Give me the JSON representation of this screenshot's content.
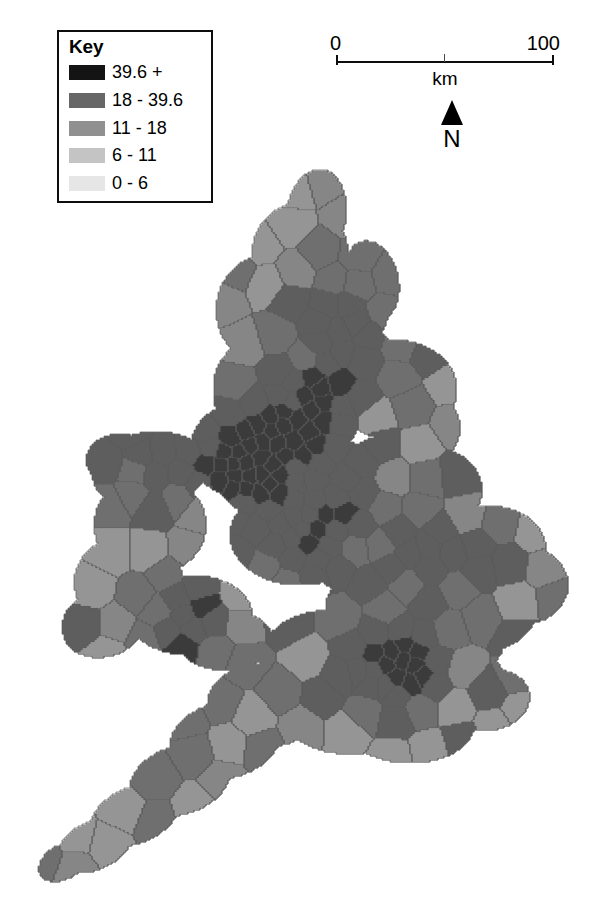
{
  "legend": {
    "title": "Key",
    "classes": [
      {
        "label": "39.6 +",
        "color": "#141414",
        "range_min": 39.6,
        "range_max": null
      },
      {
        "label": "18 - 39.6",
        "color": "#676767",
        "range_min": 18,
        "range_max": 39.6
      },
      {
        "label": "11 - 18",
        "color": "#909090",
        "range_min": 11,
        "range_max": 18
      },
      {
        "label": "6 - 11",
        "color": "#c4c4c4",
        "range_min": 6,
        "range_max": 11
      },
      {
        "label": "0 - 6",
        "color": "#e6e6e6",
        "range_min": 0,
        "range_max": 6
      }
    ]
  },
  "scalebar": {
    "min_label": "0",
    "max_label": "100",
    "unit_label": "km",
    "ticks": [
      "0",
      "50",
      "100"
    ]
  },
  "north_arrow": {
    "label": "N",
    "icon": "north-arrow-triangle-icon"
  },
  "map": {
    "title": "",
    "region": "England and Wales",
    "outline_color": "#5a5a5a",
    "background": "#ffffff",
    "projection_note": "",
    "class_count": 5
  },
  "chart_data": {
    "type": "heatmap",
    "title": "",
    "subtitle": "",
    "xlabel": "",
    "ylabel": "",
    "legend_title": "Key",
    "legend_position": "top-left",
    "grid": false,
    "map_type": "choropleth",
    "region": "England and Wales",
    "class_breaks": [
      0,
      6,
      11,
      18,
      39.6
    ],
    "class_labels": [
      "0 - 6",
      "6 - 11",
      "11 - 18",
      "18 - 39.6",
      "39.6 +"
    ],
    "class_colors": [
      "#e6e6e6",
      "#c4c4c4",
      "#909090",
      "#676767",
      "#141414"
    ],
    "scale_km": [
      0,
      100
    ],
    "area_classes": {
      "northumberland": "0 - 6",
      "cumbria": "18 - 39.6",
      "tyneside": "39.6 +",
      "durham": "11 - 18",
      "north-yorkshire": "0 - 6",
      "west-yorkshire": "39.6 +",
      "south-yorkshire": "18 - 39.6",
      "lancashire": "18 - 39.6",
      "greater-manchester": "39.6 +",
      "merseyside": "39.6 +",
      "cheshire": "6 - 11",
      "lincolnshire": "0 - 6",
      "nottinghamshire": "11 - 18",
      "derbyshire": "6 - 11",
      "west-midlands": "39.6 +",
      "north-wales": "39.6 +",
      "mid-wales": "18 - 39.6",
      "south-wales": "39.6 +",
      "west-wales": "11 - 18",
      "shropshire": "6 - 11",
      "herefordshire": "18 - 39.6",
      "gloucestershire": "11 - 18",
      "norfolk": "0 - 6",
      "suffolk": "6 - 11",
      "essex": "11 - 18",
      "cambridgeshire": "6 - 11",
      "bedfordshire": "18 - 39.6",
      "greater-london": "39.6 +",
      "kent": "11 - 18",
      "sussex": "11 - 18",
      "hampshire": "11 - 18",
      "dorset": "6 - 11",
      "devon": "11 - 18",
      "cornwall": "11 - 18",
      "somerset": "11 - 18",
      "wiltshire": "11 - 18",
      "oxfordshire": "6 - 11",
      "northamptonshire": "18 - 39.6",
      "leicestershire": "11 - 18",
      "warwickshire": "11 - 18",
      "staffordshire": "11 - 18"
    }
  }
}
